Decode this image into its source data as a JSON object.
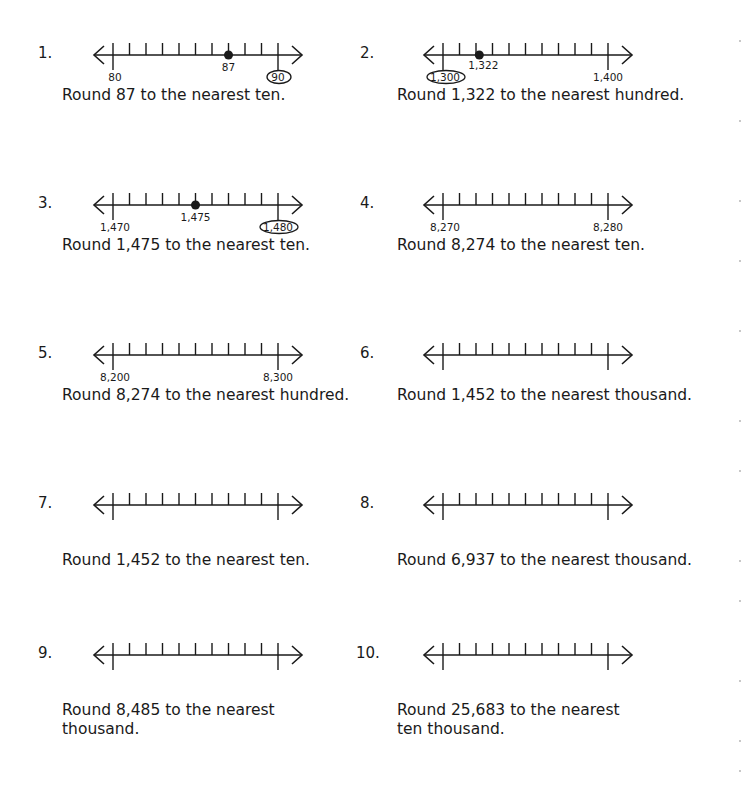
{
  "worksheet": {
    "problems": [
      {
        "number": "1.",
        "prompt": [
          "Round 87 to the nearest ten."
        ],
        "line": {
          "left_label": "80",
          "right_label": "90",
          "point_label": "87",
          "point_index": 7,
          "circled": "right"
        }
      },
      {
        "number": "2.",
        "prompt": [
          "Round 1,322 to the nearest hundred."
        ],
        "line": {
          "left_label": "1,300",
          "right_label": "1,400",
          "point_label": "1,322",
          "point_index": 2.2,
          "circled": "left"
        }
      },
      {
        "number": "3.",
        "prompt": [
          "Round 1,475 to the nearest ten."
        ],
        "line": {
          "left_label": "1,470",
          "right_label": "1,480",
          "point_label": "1,475",
          "point_index": 5,
          "circled": "right"
        }
      },
      {
        "number": "4.",
        "prompt": [
          "Round 8,274 to the nearest ten."
        ],
        "line": {
          "left_label": "8,270",
          "right_label": "8,280",
          "point_label": null,
          "point_index": null,
          "circled": null
        }
      },
      {
        "number": "5.",
        "prompt": [
          "Round 8,274 to the nearest hundred."
        ],
        "line": {
          "left_label": "8,200",
          "right_label": "8,300",
          "point_label": null,
          "point_index": null,
          "circled": null
        }
      },
      {
        "number": "6.",
        "prompt": [
          "Round 1,452 to the nearest thousand."
        ],
        "line": {
          "left_label": null,
          "right_label": null,
          "point_label": null,
          "point_index": null,
          "circled": null
        }
      },
      {
        "number": "7.",
        "prompt": [
          "Round 1,452 to the nearest ten."
        ],
        "line": {
          "left_label": null,
          "right_label": null,
          "point_label": null,
          "point_index": null,
          "circled": null
        }
      },
      {
        "number": "8.",
        "prompt": [
          "Round 6,937 to the nearest thousand."
        ],
        "line": {
          "left_label": null,
          "right_label": null,
          "point_label": null,
          "point_index": null,
          "circled": null
        }
      },
      {
        "number": "9.",
        "prompt": [
          "Round 8,485 to the nearest",
          "thousand."
        ],
        "line": {
          "left_label": null,
          "right_label": null,
          "point_label": null,
          "point_index": null,
          "circled": null
        }
      },
      {
        "number": "10.",
        "prompt": [
          "Round 25,683 to the nearest",
          "ten thousand."
        ],
        "line": {
          "left_label": null,
          "right_label": null,
          "point_label": null,
          "point_index": null,
          "circled": null
        }
      }
    ],
    "tick_count": 11,
    "colors": {
      "ink": "#1a1a1a",
      "paper": "#ffffff"
    }
  }
}
